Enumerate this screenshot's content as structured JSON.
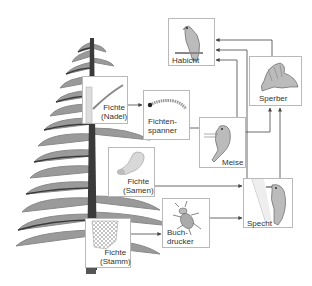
{
  "colors": {
    "tree_branch": "#8a8a8a",
    "tree_trunk": "#3a3a3a",
    "box_border": "#b9b9b9",
    "arrow": "#444444",
    "label": "#333333"
  },
  "nodes": {
    "habicht": {
      "label": "Habicht",
      "icon": "hawk-icon"
    },
    "sperber": {
      "label": "Sperber",
      "icon": "sparrowhawk-icon"
    },
    "fichte_nadel": {
      "label": "Fichte\n(Nadel)",
      "icon": "spruce-needle-icon"
    },
    "fichtenspanner": {
      "label": "Fichten-\nspanner",
      "icon": "caterpillar-icon"
    },
    "meise": {
      "label": "Meise",
      "icon": "tit-bird-icon"
    },
    "fichte_samen": {
      "label": "Fichte\n(Samen)",
      "icon": "spruce-seed-icon"
    },
    "specht": {
      "label": "Specht",
      "icon": "woodpecker-icon"
    },
    "fichte_stamm": {
      "label": "Fichte\n(Stamm)",
      "icon": "bark-icon"
    },
    "buchdrucker": {
      "label": "Buch-\ndrucker",
      "icon": "bark-beetle-icon"
    }
  },
  "edges": [
    {
      "from": "Fichte (Nadel)",
      "to": "Fichtenspanner"
    },
    {
      "from": "Fichtenspanner",
      "to": "Meise"
    },
    {
      "from": "Meise",
      "to": "Habicht"
    },
    {
      "from": "Meise",
      "to": "Sperber"
    },
    {
      "from": "Fichte (Samen)",
      "to": "Specht"
    },
    {
      "from": "Fichte (Stamm)",
      "to": "Buchdrucker"
    },
    {
      "from": "Buchdrucker",
      "to": "Specht"
    },
    {
      "from": "Specht",
      "to": "Habicht"
    },
    {
      "from": "Specht",
      "to": "Sperber"
    },
    {
      "from": "Sperber",
      "to": "Habicht"
    }
  ]
}
